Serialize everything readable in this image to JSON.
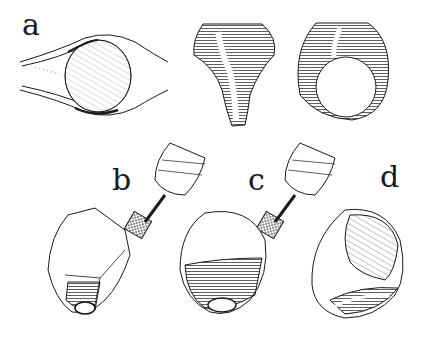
{
  "figure": {
    "labels": {
      "a": "a",
      "b": "b",
      "c": "c",
      "d": "d"
    },
    "panels": [
      {
        "id": "a",
        "description": "ring seen from above: oval gemstone set in band"
      },
      {
        "id": "a-front",
        "description": "ring shank, front view"
      },
      {
        "id": "a-side",
        "description": "ring, side view with finger hole"
      },
      {
        "id": "b",
        "description": "faceted stone block with burr drill"
      },
      {
        "id": "c",
        "description": "stone further shaped with burr drill"
      },
      {
        "id": "d",
        "description": "finished stone ring"
      }
    ],
    "colors": {
      "ink": "#1a1a1a",
      "paper": "#ffffff"
    }
  }
}
